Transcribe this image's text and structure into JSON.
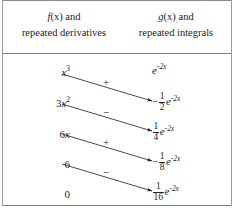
{
  "figure": {
    "kind": "tabular-integration-table",
    "rule_color": "#7d7d7d",
    "text_color": "#1c1c1c",
    "background": "#ffffff"
  },
  "header": {
    "left": {
      "line1_fn": "f",
      "line1_arg": "(x)",
      "line1_tail": " and",
      "line2": "repeated derivatives"
    },
    "right": {
      "line1_fn": "g",
      "line1_arg": "(x)",
      "line1_tail": " and",
      "line2": "repeated integrals"
    }
  },
  "rows": [
    {
      "left": {
        "base": "x",
        "exp": "3",
        "plain": "x^3"
      },
      "right": {
        "sign": "",
        "frac_num": "",
        "frac_den": "",
        "exp_base": "e",
        "exp_power": "-2x",
        "plain": "e^{-2x}"
      },
      "arrow_sign": "+"
    },
    {
      "left": {
        "coeff": "3",
        "base": "x",
        "exp": "2",
        "plain": "3x^2"
      },
      "right": {
        "sign": "−",
        "frac_num": "1",
        "frac_den": "2",
        "exp_base": "e",
        "exp_power": "-2x",
        "plain": "-1/2 e^{-2x}"
      },
      "arrow_sign": "−"
    },
    {
      "left": {
        "coeff": "6",
        "base": "x",
        "exp": "",
        "plain": "6x"
      },
      "right": {
        "sign": "",
        "frac_num": "1",
        "frac_den": "4",
        "exp_base": "e",
        "exp_power": "-2x",
        "plain": "1/4 e^{-2x}"
      },
      "arrow_sign": "+"
    },
    {
      "left": {
        "coeff": "6",
        "base": "",
        "exp": "",
        "plain": "6"
      },
      "right": {
        "sign": "−",
        "frac_num": "1",
        "frac_den": "8",
        "exp_base": "e",
        "exp_power": "-2x",
        "plain": "-1/8 e^{-2x}"
      },
      "arrow_sign": "−"
    },
    {
      "left": {
        "coeff": "0",
        "base": "",
        "exp": "",
        "plain": "0"
      },
      "right": {
        "sign": "",
        "frac_num": "1",
        "frac_den": "16",
        "exp_base": "e",
        "exp_power": "-2x",
        "plain": "1/16 e^{-2x}"
      },
      "arrow_sign": ""
    }
  ],
  "arrows": [
    {
      "from_row": 0,
      "to_row": 1,
      "sign": "+",
      "x1": 62,
      "y1": 74,
      "x2": 152,
      "y2": 101
    },
    {
      "from_row": 1,
      "to_row": 2,
      "sign": "−",
      "x1": 62,
      "y1": 104,
      "x2": 152,
      "y2": 131
    },
    {
      "from_row": 2,
      "to_row": 3,
      "sign": "+",
      "x1": 62,
      "y1": 134,
      "x2": 152,
      "y2": 161
    },
    {
      "from_row": 3,
      "to_row": 4,
      "sign": "−",
      "x1": 62,
      "y1": 164,
      "x2": 152,
      "y2": 191
    }
  ]
}
